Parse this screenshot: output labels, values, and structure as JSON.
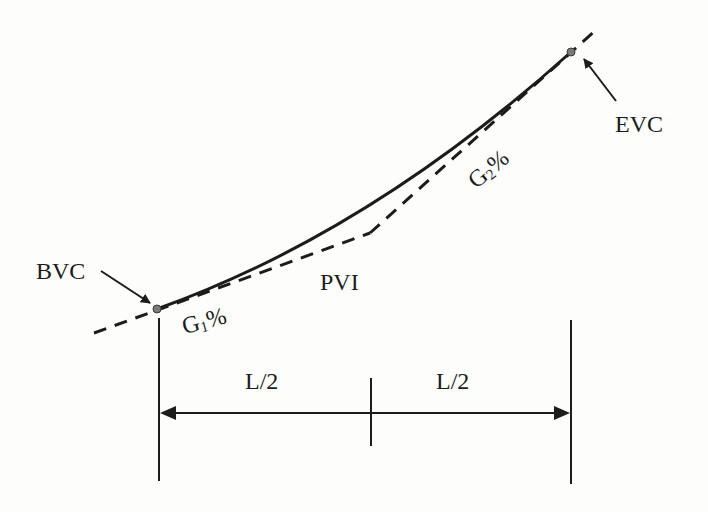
{
  "figure": {
    "type": "crest/sag vertical curve diagram (sag)",
    "labels": {
      "bvc": "BVC",
      "evc": "EVC",
      "pvi": "PVI",
      "grade1_base": "G",
      "grade1_sub": "1",
      "grade1_suffix": "%",
      "grade2_base": "G",
      "grade2_sub": "2",
      "grade2_suffix": "%",
      "half_length_left": "L/2",
      "half_length_right": "L/2"
    },
    "points": {
      "bvc": [
        157,
        309
      ],
      "pvi": [
        370,
        233
      ],
      "evc": [
        571,
        52
      ]
    },
    "colors": {
      "ink": "#1c1c1c",
      "point_fill": "#7a7a7a",
      "background": "#fdfdfc"
    }
  }
}
